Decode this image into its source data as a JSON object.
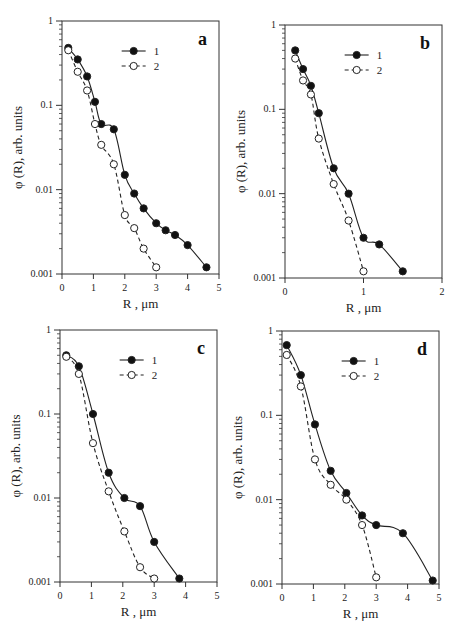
{
  "figure": {
    "panels": [
      "a",
      "b",
      "c",
      "d"
    ]
  },
  "chart_data": [
    {
      "type": "line",
      "panel_label": "a",
      "xlabel": "R , μm",
      "ylabel": "φ (R), arb. units",
      "yscale": "log",
      "xlim": [
        0,
        5
      ],
      "ylim": [
        0.001,
        1
      ],
      "xticks": [
        "0",
        "1",
        "2",
        "3",
        "4",
        "5"
      ],
      "yticks": [
        "0.001",
        "0.01",
        "0.1",
        "1"
      ],
      "legend": [
        "1",
        "2"
      ],
      "legend_position": "upper center",
      "grid": false,
      "series": [
        {
          "name": "1",
          "marker": "filled-circle",
          "line": "solid",
          "x": [
            0.2,
            0.5,
            0.8,
            1.05,
            1.25,
            1.65,
            2.0,
            2.3,
            2.6,
            3.0,
            3.3,
            3.6,
            4.0,
            4.6
          ],
          "y": [
            0.48,
            0.35,
            0.22,
            0.11,
            0.06,
            0.052,
            0.015,
            0.009,
            0.006,
            0.004,
            0.0033,
            0.0029,
            0.0022,
            0.0012
          ]
        },
        {
          "name": "2",
          "marker": "open-circle",
          "line": "dashed",
          "x": [
            0.2,
            0.5,
            0.8,
            1.05,
            1.25,
            1.65,
            2.0,
            2.3,
            2.6,
            3.0
          ],
          "y": [
            0.45,
            0.25,
            0.15,
            0.06,
            0.034,
            0.02,
            0.005,
            0.0035,
            0.002,
            0.0012
          ]
        }
      ]
    },
    {
      "type": "line",
      "panel_label": "b",
      "xlabel": "R , μm",
      "ylabel": "φ (R), arb. units",
      "yscale": "log",
      "xlim": [
        0,
        2
      ],
      "ylim": [
        0.001,
        1
      ],
      "xticks": [
        "0",
        "1",
        "2"
      ],
      "yticks": [
        "0.001",
        "0.01",
        "0.1",
        "1"
      ],
      "legend": [
        "1",
        "2"
      ],
      "legend_position": "upper center",
      "grid": false,
      "series": [
        {
          "name": "1",
          "marker": "filled-circle",
          "line": "solid",
          "x": [
            0.13,
            0.23,
            0.33,
            0.43,
            0.62,
            0.81,
            1.0,
            1.2,
            1.5
          ],
          "y": [
            0.5,
            0.3,
            0.19,
            0.09,
            0.02,
            0.01,
            0.003,
            0.0025,
            0.0012
          ]
        },
        {
          "name": "2",
          "marker": "open-circle",
          "line": "dashed",
          "x": [
            0.13,
            0.23,
            0.33,
            0.43,
            0.62,
            0.81,
            1.0
          ],
          "y": [
            0.4,
            0.22,
            0.15,
            0.045,
            0.013,
            0.0048,
            0.0012
          ]
        }
      ]
    },
    {
      "type": "line",
      "panel_label": "c",
      "xlabel": "R , μm",
      "ylabel": "φ (R), arb. units",
      "yscale": "log",
      "xlim": [
        0,
        5
      ],
      "ylim": [
        0.001,
        1
      ],
      "xticks": [
        "0",
        "1",
        "2",
        "3",
        "4",
        "5"
      ],
      "yticks": [
        "0.001",
        "0.01",
        "0.1",
        "1"
      ],
      "legend": [
        "1",
        "2"
      ],
      "legend_position": "upper center",
      "grid": false,
      "series": [
        {
          "name": "1",
          "marker": "filled-circle",
          "line": "solid",
          "x": [
            0.2,
            0.6,
            1.05,
            1.55,
            2.05,
            2.55,
            3.0,
            3.8
          ],
          "y": [
            0.5,
            0.37,
            0.1,
            0.02,
            0.01,
            0.008,
            0.003,
            0.0011
          ]
        },
        {
          "name": "2",
          "marker": "open-circle",
          "line": "dashed",
          "x": [
            0.2,
            0.6,
            1.05,
            1.55,
            2.05,
            2.55,
            3.0
          ],
          "y": [
            0.48,
            0.3,
            0.045,
            0.012,
            0.004,
            0.0015,
            0.0011
          ]
        }
      ]
    },
    {
      "type": "line",
      "panel_label": "d",
      "xlabel": "R , μm",
      "ylabel": "φ (R), arb. units",
      "yscale": "log",
      "xlim": [
        0,
        5
      ],
      "ylim": [
        0.001,
        1
      ],
      "xticks": [
        "0",
        "1",
        "2",
        "3",
        "4",
        "5"
      ],
      "yticks": [
        "0.001",
        "0.01",
        "0.1",
        "1"
      ],
      "legend": [
        "1",
        "2"
      ],
      "legend_position": "upper center",
      "grid": false,
      "series": [
        {
          "name": "1",
          "marker": "filled-circle",
          "line": "solid",
          "x": [
            0.15,
            0.6,
            1.05,
            1.55,
            2.05,
            2.55,
            3.0,
            3.85,
            4.8
          ],
          "y": [
            0.68,
            0.3,
            0.078,
            0.022,
            0.012,
            0.0065,
            0.005,
            0.004,
            0.0011
          ]
        },
        {
          "name": "2",
          "marker": "open-circle",
          "line": "dashed",
          "x": [
            0.15,
            0.6,
            1.05,
            1.55,
            2.05,
            2.55,
            3.0
          ],
          "y": [
            0.52,
            0.22,
            0.03,
            0.015,
            0.01,
            0.005,
            0.0012
          ]
        }
      ]
    }
  ],
  "layout": [
    {
      "left": 62,
      "right": 219,
      "top": 21,
      "bottom": 274
    },
    {
      "left": 285,
      "right": 442,
      "top": 25,
      "bottom": 278
    },
    {
      "left": 60,
      "right": 217,
      "top": 330,
      "bottom": 582
    },
    {
      "left": 282,
      "right": 439,
      "top": 331,
      "bottom": 584
    }
  ]
}
